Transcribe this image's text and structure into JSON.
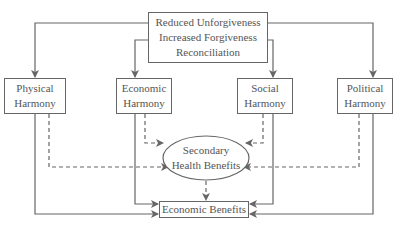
{
  "diagram": {
    "top_box": {
      "lines": [
        "Reduced Unforgiveness",
        "Increased Forgiveness",
        "Reconciliation"
      ]
    },
    "harmony_boxes": [
      {
        "lines": [
          "Physical",
          "Harmony"
        ]
      },
      {
        "lines": [
          "Economic",
          "Harmony"
        ]
      },
      {
        "lines": [
          "Social",
          "Harmony"
        ]
      },
      {
        "lines": [
          "Political",
          "Harmony"
        ]
      }
    ],
    "secondary": {
      "lines": [
        "Secondary",
        "Health Benefits"
      ]
    },
    "bottom_box": {
      "label": "Economic Benefits"
    },
    "colors": {
      "line": "#666666",
      "text": "#555555",
      "background": "#ffffff"
    }
  }
}
